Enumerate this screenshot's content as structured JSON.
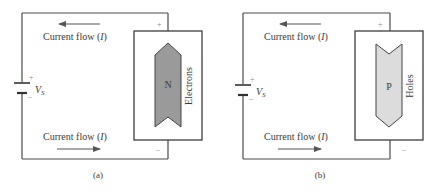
{
  "panels": [
    {
      "id": "a",
      "caption": "(a)",
      "top_label": "Current flow (",
      "top_label_italic": "I",
      "top_label_close": ")",
      "bottom_label": "Current flow (",
      "bottom_label_italic": "I",
      "bottom_label_close": ")",
      "source_label": "V",
      "source_subscript": "S",
      "source_plus": "+",
      "source_minus": "–",
      "terminal_plus": "+",
      "terminal_minus": "–",
      "material_letter": "N",
      "carrier_label": "Electrons",
      "carrier_direction": "up",
      "fill_color": "#9a9a9a"
    },
    {
      "id": "b",
      "caption": "(b)",
      "top_label": "Current flow (",
      "top_label_italic": "I",
      "top_label_close": ")",
      "bottom_label": "Current flow (",
      "bottom_label_italic": "I",
      "bottom_label_close": ")",
      "source_label": "V",
      "source_subscript": "S",
      "source_plus": "+",
      "source_minus": "–",
      "terminal_plus": "+",
      "terminal_minus": "–",
      "material_letter": "P",
      "carrier_label": "Holes",
      "carrier_direction": "down",
      "fill_color": "#dcdcdc"
    }
  ]
}
